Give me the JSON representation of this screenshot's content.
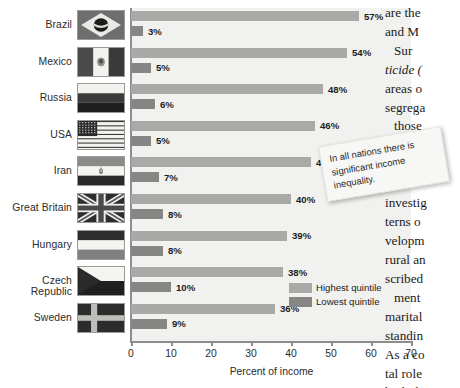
{
  "chart_data": {
    "type": "bar",
    "orientation": "horizontal",
    "title": "",
    "xlabel": "Percent of income",
    "ylabel": "",
    "xlim": [
      0,
      70
    ],
    "xticks": [
      0,
      10,
      20,
      30,
      40,
      50,
      60,
      70
    ],
    "grid": false,
    "legend_position": "inside-bottom-right",
    "categories": [
      "Brazil",
      "Mexico",
      "Russia",
      "USA",
      "Iran",
      "Great Britain",
      "Hungary",
      "Czech Republic",
      "Sweden"
    ],
    "series": [
      {
        "name": "Highest quintile",
        "color": "#a9a9a7",
        "values": [
          57,
          54,
          48,
          46,
          45,
          40,
          39,
          38,
          36
        ],
        "labels": [
          "57%",
          "54%",
          "48%",
          "46%",
          "45%",
          "40%",
          "39%",
          "38%",
          "36%"
        ]
      },
      {
        "name": "Lowest quintile",
        "color": "#868684",
        "values": [
          3,
          5,
          6,
          5,
          7,
          8,
          8,
          10,
          9
        ],
        "labels": [
          "3%",
          "5%",
          "6%",
          "5%",
          "7%",
          "8%",
          "8%",
          "10%",
          "9%"
        ]
      }
    ]
  },
  "chart": {
    "flag_names": [
      "flag-brazil",
      "flag-mexico",
      "flag-russia",
      "flag-usa",
      "flag-iran",
      "flag-great-britain",
      "flag-hungary",
      "flag-czech-republic",
      "flag-sweden"
    ],
    "axis_label": "Percent of income",
    "plot_background": "#f1f1ef",
    "axis_color": "#8d8d8d"
  },
  "annotation_note": {
    "lines": [
      "In all nations there is",
      "significant income",
      "inequality."
    ],
    "text": "In all nations there is significant income inequality."
  },
  "book_column": {
    "lines": [
      {
        "text": "are the",
        "indent": false,
        "italic": false
      },
      {
        "text": "and M",
        "indent": false,
        "italic": false
      },
      {
        "text": "Sur",
        "indent": true,
        "italic": false
      },
      {
        "text": "ticide (",
        "indent": false,
        "italic": true
      },
      {
        "text": "areas o",
        "indent": false,
        "italic": false
      },
      {
        "text": "segrega",
        "indent": false,
        "italic": false
      },
      {
        "text": "those",
        "indent": true,
        "italic": false
      }
    ],
    "lines2": [
      {
        "text": "investig",
        "indent": false,
        "italic": false
      },
      {
        "text": "terns o",
        "indent": false,
        "italic": false
      },
      {
        "text": "velopm",
        "indent": false,
        "italic": false
      },
      {
        "text": "rural an",
        "indent": false,
        "italic": false
      },
      {
        "text": "scribed",
        "indent": false,
        "italic": false
      },
      {
        "text": "ment",
        "indent": true,
        "italic": false
      },
      {
        "text": "marital",
        "indent": false,
        "italic": false
      },
      {
        "text": "standin",
        "indent": false,
        "italic": false
      },
      {
        "text": "As a co",
        "indent": false,
        "italic": false
      },
      {
        "text": "tal role",
        "indent": false,
        "italic": false
      },
      {
        "text": "both th",
        "indent": false,
        "italic": false
      }
    ]
  }
}
